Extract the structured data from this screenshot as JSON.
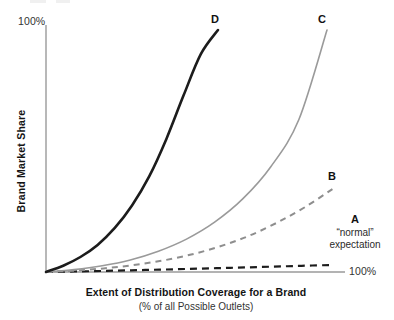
{
  "figure": {
    "background": "#ffffff",
    "width": 394,
    "height": 320
  },
  "axes": {
    "y_title": "Brand Market Share",
    "y_tick_top": "100%",
    "x_title": "Extent of Distribution Coverage for a Brand",
    "x_subtitle": "(% of all Possible Outlets)",
    "x_tick_right": "100%",
    "axis_color": "#9a9a9a"
  },
  "annotations": {
    "a_label": "A",
    "a_note_line1": "“normal”",
    "a_note_line2": "expectation",
    "b_label": "B",
    "c_label": "C",
    "d_label": "D"
  },
  "chart_data": {
    "type": "line",
    "title": "",
    "xlabel": "Extent of Distribution Coverage for a Brand (% of all Possible Outlets)",
    "ylabel": "Brand Market Share",
    "xlim": [
      0,
      100
    ],
    "ylim": [
      0,
      100
    ],
    "xtick_labels": [
      "100%"
    ],
    "ytick_labels": [
      "100%"
    ],
    "grid": false,
    "legend": "inline-curve-labels",
    "x": [
      0,
      10,
      20,
      30,
      40,
      50,
      60,
      70,
      80,
      90,
      100
    ],
    "series": [
      {
        "name": "A",
        "label": "A",
        "annotation": "“normal” expectation",
        "style": "dashed",
        "color": "#1c1c1c",
        "width": 2.2,
        "values": [
          0,
          0.6,
          1.3,
          2.1,
          2.9,
          3.8,
          4.7,
          5.6,
          6.6,
          7.6,
          8.6
        ]
      },
      {
        "name": "B",
        "label": "B",
        "style": "dashed",
        "color": "#8e8e8e",
        "width": 2.0,
        "values": [
          0,
          0.7,
          1.8,
          3.4,
          5.6,
          8.6,
          12.6,
          17.8,
          24.5,
          32.5,
          42.0
        ]
      },
      {
        "name": "C",
        "label": "C",
        "style": "solid",
        "color": "#9a9a9a",
        "width": 1.6,
        "values": [
          0,
          1.0,
          2.6,
          5.0,
          8.6,
          13.6,
          20.6,
          30.2,
          43.5,
          63.0,
          100.0
        ]
      },
      {
        "name": "D",
        "label": "D",
        "style": "solid",
        "color": "#1c1c1c",
        "width": 2.6,
        "values": [
          0,
          2.6,
          6.2,
          11.2,
          18.2,
          27.5,
          39.5,
          55.0,
          73.0,
          90.0,
          100.0
        ]
      }
    ]
  }
}
